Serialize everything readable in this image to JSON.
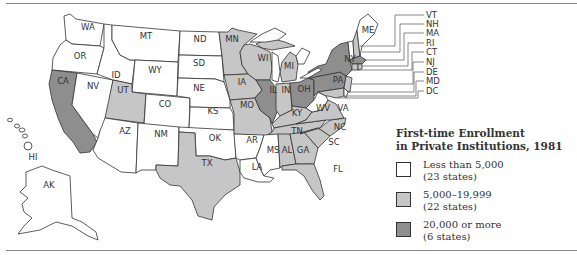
{
  "legend": {
    "title_line1": "First-time Enrollment",
    "title_line2": "in Private Institutions, 1981",
    "items": [
      {
        "range": "Less than 5,000",
        "count": "(23 states)",
        "color": "#ffffff"
      },
      {
        "range": "5,000–19,999",
        "count": "(22 states)",
        "color": "#c6c6c6"
      },
      {
        "range": "20,000 or more",
        "count": "(6 states)",
        "color": "#8e8e8e"
      }
    ]
  },
  "colors": {
    "low": "#ffffff",
    "mid": "#c6c6c6",
    "high": "#8e8e8e",
    "outline": "#333333"
  },
  "callouts": [
    "VT",
    "NH",
    "MA",
    "RI",
    "CT",
    "NJ",
    "DE",
    "MD",
    "DC"
  ],
  "states": {
    "WA": {
      "label": "WA",
      "category": "low"
    },
    "OR": {
      "label": "OR",
      "category": "low"
    },
    "CA": {
      "label": "CA",
      "category": "high"
    },
    "NV": {
      "label": "NV",
      "category": "low"
    },
    "ID": {
      "label": "ID",
      "category": "low"
    },
    "MT": {
      "label": "MT",
      "category": "low"
    },
    "WY": {
      "label": "WY",
      "category": "low"
    },
    "UT": {
      "label": "UT",
      "category": "mid"
    },
    "AZ": {
      "label": "AZ",
      "category": "low"
    },
    "CO": {
      "label": "CO",
      "category": "low"
    },
    "NM": {
      "label": "NM",
      "category": "low"
    },
    "ND": {
      "label": "ND",
      "category": "low"
    },
    "SD": {
      "label": "SD",
      "category": "low"
    },
    "NE": {
      "label": "NE",
      "category": "low"
    },
    "KS": {
      "label": "KS",
      "category": "low"
    },
    "OK": {
      "label": "OK",
      "category": "low"
    },
    "TX": {
      "label": "TX",
      "category": "mid"
    },
    "MN": {
      "label": "MN",
      "category": "mid"
    },
    "IA": {
      "label": "IA",
      "category": "mid"
    },
    "MO": {
      "label": "MO",
      "category": "mid"
    },
    "AR": {
      "label": "AR",
      "category": "low"
    },
    "LA": {
      "label": "LA",
      "category": "low"
    },
    "WI": {
      "label": "WI",
      "category": "mid"
    },
    "IL": {
      "label": "IL",
      "category": "high"
    },
    "MI": {
      "label": "MI",
      "category": "mid"
    },
    "IN": {
      "label": "IN",
      "category": "mid"
    },
    "OH": {
      "label": "OH",
      "category": "high"
    },
    "KY": {
      "label": "KY",
      "category": "mid"
    },
    "TN": {
      "label": "TN",
      "category": "mid"
    },
    "MS": {
      "label": "MS",
      "category": "low"
    },
    "AL": {
      "label": "AL",
      "category": "mid"
    },
    "GA": {
      "label": "GA",
      "category": "mid"
    },
    "FL": {
      "label": "FL",
      "category": "mid"
    },
    "SC": {
      "label": "SC",
      "category": "mid"
    },
    "NC": {
      "label": "NC",
      "category": "mid"
    },
    "VA": {
      "label": "VA",
      "category": "mid"
    },
    "WV": {
      "label": "WV",
      "category": "low"
    },
    "PA": {
      "label": "PA",
      "category": "high"
    },
    "NY": {
      "label": "NY",
      "category": "high"
    },
    "ME": {
      "label": "ME",
      "category": "low"
    },
    "VT": {
      "label": "VT",
      "category": "low"
    },
    "NH": {
      "label": "NH",
      "category": "mid"
    },
    "MA": {
      "label": "MA",
      "category": "high"
    },
    "RI": {
      "label": "RI",
      "category": "mid"
    },
    "CT": {
      "label": "CT",
      "category": "mid"
    },
    "NJ": {
      "label": "NJ",
      "category": "mid"
    },
    "DE": {
      "label": "DE",
      "category": "low"
    },
    "MD": {
      "label": "MD",
      "category": "mid"
    },
    "DC": {
      "label": "DC",
      "category": "mid"
    },
    "AK": {
      "label": "AK",
      "category": "low"
    },
    "HI": {
      "label": "HI",
      "category": "low"
    }
  }
}
